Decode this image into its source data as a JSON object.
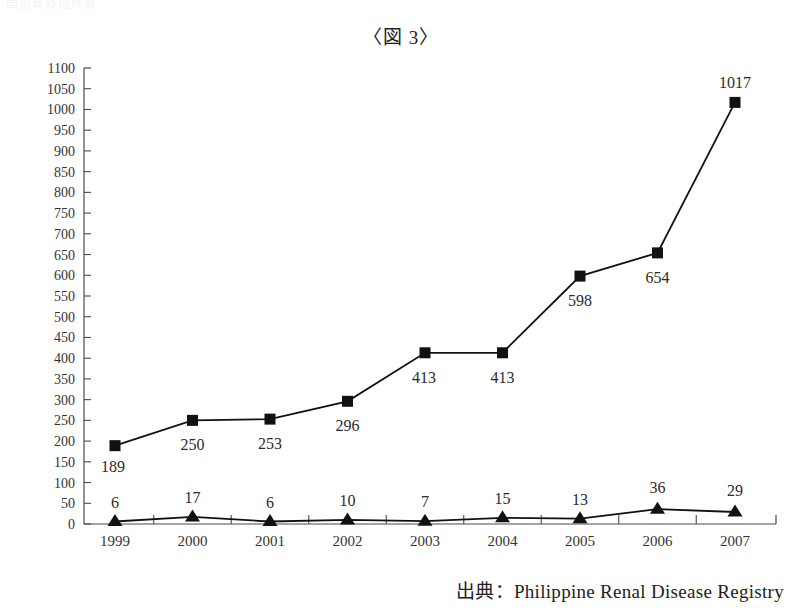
{
  "document": {
    "top_partial_text": "国別腎移植件数",
    "title": "〈図 3〉",
    "source": "出典：Philippine Renal Disease Registry"
  },
  "chart_data": {
    "type": "line",
    "title": "〈図 3〉",
    "xlabel": "",
    "ylabel": "",
    "ylim": [
      0,
      1100
    ],
    "ytick_step": 50,
    "grid": false,
    "legend": "none",
    "categories": [
      "1999",
      "2000",
      "2001",
      "2002",
      "2003",
      "2004",
      "2005",
      "2006",
      "2007"
    ],
    "ytick_labels": [
      "1100",
      "1050",
      "1000",
      "950",
      "900",
      "850",
      "800",
      "750",
      "700",
      "650",
      "600",
      "550",
      "500",
      "450",
      "400",
      "350",
      "300",
      "250",
      "200",
      "150",
      "100",
      "50",
      "0"
    ],
    "series": [
      {
        "name": "series-square",
        "marker": "square",
        "color": "#111111",
        "values": [
          189,
          250,
          253,
          296,
          413,
          413,
          598,
          654,
          1017
        ],
        "labels": [
          "189",
          "250",
          "253",
          "296",
          "413",
          "413",
          "598",
          "654",
          "1017"
        ]
      },
      {
        "name": "series-triangle",
        "marker": "triangle",
        "color": "#111111",
        "values": [
          6,
          17,
          6,
          10,
          7,
          15,
          13,
          36,
          29
        ],
        "labels": [
          "6",
          "17",
          "6",
          "10",
          "7",
          "15",
          "13",
          "36",
          "29"
        ]
      }
    ]
  }
}
